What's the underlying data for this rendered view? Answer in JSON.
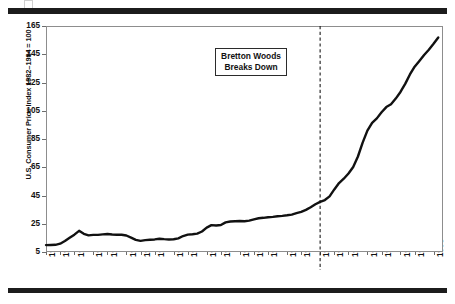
{
  "figure": {
    "y_axis_title": "U.S. Consumer Price Index 1982–1984 = 100",
    "annotation_line1": "Bretton Woods",
    "annotation_line2": "Breaks Down",
    "rule_color": "#1c1c1c",
    "line_color": "#111111",
    "frame_color": "#8d8d8d"
  },
  "chart_data": {
    "type": "line",
    "title": "",
    "subtitle": "",
    "xlabel": "",
    "ylabel": "U.S. Consumer Price Index 1982–1984 = 100",
    "xlim": [
      1913,
      1997
    ],
    "ylim": [
      5,
      165
    ],
    "grid": false,
    "legend": "none",
    "y_ticks": [
      5,
      25,
      45,
      65,
      85,
      105,
      125,
      145,
      165
    ],
    "x_ticks": [
      1913,
      1916,
      1919,
      1923,
      1926,
      1930,
      1933,
      1936,
      1940,
      1943,
      1947,
      1950,
      1954,
      1957,
      1960,
      1964,
      1967,
      1971,
      1974,
      1977,
      1981,
      1984,
      1988,
      1991,
      1995
    ],
    "annotations": [
      {
        "text": "Bretton Woods Breaks Down",
        "x": 1971,
        "type": "vline-label",
        "line_style": "dashed"
      }
    ],
    "series": [
      {
        "name": "U.S. Consumer Price Index",
        "x": [
          1913,
          1914,
          1915,
          1916,
          1917,
          1918,
          1919,
          1920,
          1921,
          1922,
          1923,
          1924,
          1925,
          1926,
          1927,
          1928,
          1929,
          1930,
          1931,
          1932,
          1933,
          1934,
          1935,
          1936,
          1937,
          1938,
          1939,
          1940,
          1941,
          1942,
          1943,
          1944,
          1945,
          1946,
          1947,
          1948,
          1949,
          1950,
          1951,
          1952,
          1953,
          1954,
          1955,
          1956,
          1957,
          1958,
          1959,
          1960,
          1961,
          1962,
          1963,
          1964,
          1965,
          1966,
          1967,
          1968,
          1969,
          1970,
          1971,
          1972,
          1973,
          1974,
          1975,
          1976,
          1977,
          1978,
          1979,
          1980,
          1981,
          1982,
          1983,
          1984,
          1985,
          1986,
          1987,
          1988,
          1989,
          1990,
          1991,
          1992,
          1993,
          1994,
          1995,
          1996
        ],
        "values": [
          9.9,
          10.0,
          10.1,
          10.9,
          12.8,
          15.1,
          17.3,
          20.0,
          17.9,
          16.8,
          17.1,
          17.1,
          17.5,
          17.7,
          17.4,
          17.2,
          17.2,
          16.7,
          15.2,
          13.6,
          12.9,
          13.4,
          13.7,
          13.9,
          14.4,
          14.1,
          13.9,
          14.0,
          14.7,
          16.3,
          17.3,
          17.6,
          18.0,
          19.5,
          22.3,
          24.0,
          23.8,
          24.1,
          26.0,
          26.6,
          26.8,
          26.9,
          26.8,
          27.2,
          28.1,
          28.9,
          29.2,
          29.6,
          29.9,
          30.3,
          30.6,
          31.0,
          31.5,
          32.5,
          33.4,
          34.8,
          36.7,
          38.8,
          40.5,
          41.8,
          44.4,
          49.3,
          53.8,
          56.9,
          60.6,
          65.2,
          72.6,
          82.4,
          90.9,
          96.5,
          99.6,
          103.9,
          107.6,
          109.6,
          113.6,
          118.3,
          124.0,
          130.7,
          136.2,
          140.3,
          144.5,
          148.2,
          152.4,
          156.9
        ]
      }
    ]
  }
}
